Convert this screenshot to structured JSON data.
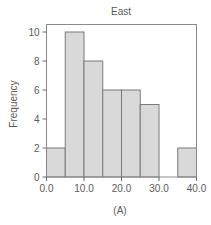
{
  "chart_data": {
    "type": "bar",
    "subtype": "histogram",
    "title": "East",
    "xlabel": "(A)",
    "ylabel": "Frequency",
    "bin_edges": [
      0,
      5,
      10,
      15,
      20,
      25,
      30,
      35,
      40
    ],
    "values": [
      2,
      10,
      8,
      6,
      6,
      5,
      0,
      2
    ],
    "xlim": [
      0,
      40
    ],
    "ylim": [
      0,
      10
    ],
    "x_ticks": [
      0,
      10,
      20,
      30,
      40
    ],
    "x_tick_labels": [
      "0.0",
      "10.0",
      "20.0",
      "30.0",
      "40.0"
    ],
    "y_ticks": [
      0,
      2,
      4,
      6,
      8,
      10
    ],
    "y_tick_labels": [
      "0",
      "2",
      "4",
      "6",
      "8",
      "10"
    ],
    "grid": false,
    "legend": "none",
    "colors": {
      "bar_fill": "#d9d9d9",
      "bar_edge": "#7a7a7a",
      "text": "#5a5a5a"
    }
  }
}
